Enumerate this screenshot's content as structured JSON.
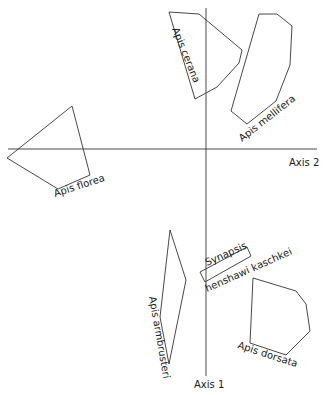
{
  "diagram": {
    "type": "ordination-plot",
    "axes": {
      "horizontal_label": "Axis 2",
      "vertical_label": "Axis 1"
    },
    "groups": [
      {
        "name": "Apis cerana",
        "label": "Apis cerana"
      },
      {
        "name": "Apis mellifera",
        "label": "Apis mellifera"
      },
      {
        "name": "Apis florea",
        "label": "Apis florea"
      },
      {
        "name": "Apis armbrusteri",
        "label": "Apis armbrusteri"
      },
      {
        "name": "Synapsis henshawi kaschkei",
        "label_line1": "Synapsis",
        "label_line2": "henshawi kaschkei"
      },
      {
        "name": "Apis dorsata",
        "label": "Apis dorsata"
      }
    ]
  }
}
